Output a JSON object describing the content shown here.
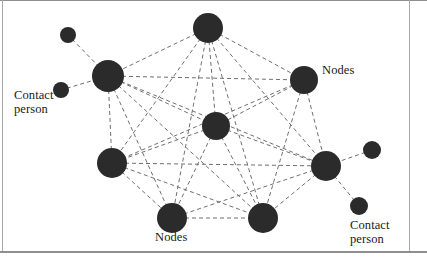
{
  "figure": {
    "width": 427,
    "height": 260,
    "background": "#ffffff",
    "frame_color": "#8e8e8e"
  },
  "style": {
    "node_fill": "#2b2b2b",
    "edge_color": "#6f6f6f",
    "edge_dash": "4 3",
    "edge_width": 1,
    "text_color": "#1a1a1a"
  },
  "labels": [
    {
      "id": "label-contact-left",
      "text": "Contact\nperson",
      "line1": "Contact",
      "line2": "person",
      "x": 14,
      "y": 88,
      "align": "left"
    },
    {
      "id": "label-nodes-right",
      "text": "Nodes",
      "line1": "Nodes",
      "line2": "",
      "x": 322,
      "y": 63,
      "align": "left"
    },
    {
      "id": "label-nodes-bottom",
      "text": "Nodes",
      "line1": "Nodes",
      "line2": "",
      "x": 155,
      "y": 230,
      "align": "left"
    },
    {
      "id": "label-contact-right",
      "text": "Contact\nperson",
      "line1": "Contact",
      "line2": "person",
      "x": 350,
      "y": 218,
      "align": "left"
    }
  ],
  "graph": {
    "node_count": 11,
    "main_node_count": 7,
    "contact_node_count": 4,
    "edge_count": 25,
    "nodes": [
      {
        "id": "n-top",
        "label": "Nodes",
        "role": "node",
        "x": 208,
        "y": 28,
        "r": 15
      },
      {
        "id": "n-upper-left",
        "label": "Nodes",
        "role": "node",
        "x": 108,
        "y": 76,
        "r": 16
      },
      {
        "id": "n-upper-right",
        "label": "Nodes",
        "role": "node",
        "x": 304,
        "y": 80,
        "r": 14
      },
      {
        "id": "n-center",
        "label": "Nodes",
        "role": "node",
        "x": 216,
        "y": 126,
        "r": 14
      },
      {
        "id": "n-lower-left",
        "label": "Nodes",
        "role": "node",
        "x": 112,
        "y": 163,
        "r": 15
      },
      {
        "id": "n-lower-right",
        "label": "Nodes",
        "role": "node",
        "x": 326,
        "y": 166,
        "r": 15
      },
      {
        "id": "n-bottom-left",
        "label": "Nodes",
        "role": "node",
        "x": 172,
        "y": 218,
        "r": 15
      },
      {
        "id": "n-bottom-right",
        "label": "Nodes",
        "role": "node",
        "x": 263,
        "y": 218,
        "r": 15
      },
      {
        "id": "c-left-top",
        "label": "Contact person",
        "role": "contact",
        "x": 68,
        "y": 35,
        "r": 8
      },
      {
        "id": "c-left-bottom",
        "label": "Contact person",
        "role": "contact",
        "x": 61,
        "y": 90,
        "r": 8
      },
      {
        "id": "c-right-top",
        "label": "Contact person",
        "role": "contact",
        "x": 372,
        "y": 150,
        "r": 9
      },
      {
        "id": "c-right-bottom",
        "label": "Contact person",
        "role": "contact",
        "x": 359,
        "y": 206,
        "r": 9
      }
    ],
    "edges": [
      {
        "from": "n-top",
        "to": "n-upper-left"
      },
      {
        "from": "n-top",
        "to": "n-upper-right"
      },
      {
        "from": "n-top",
        "to": "n-center"
      },
      {
        "from": "n-top",
        "to": "n-lower-left"
      },
      {
        "from": "n-top",
        "to": "n-lower-right"
      },
      {
        "from": "n-top",
        "to": "n-bottom-left"
      },
      {
        "from": "n-top",
        "to": "n-bottom-right"
      },
      {
        "from": "n-upper-left",
        "to": "n-upper-right"
      },
      {
        "from": "n-upper-left",
        "to": "n-center"
      },
      {
        "from": "n-upper-left",
        "to": "n-lower-left"
      },
      {
        "from": "n-upper-left",
        "to": "n-lower-right"
      },
      {
        "from": "n-upper-left",
        "to": "n-bottom-left"
      },
      {
        "from": "n-upper-left",
        "to": "n-bottom-right"
      },
      {
        "from": "n-upper-right",
        "to": "n-center"
      },
      {
        "from": "n-upper-right",
        "to": "n-lower-left"
      },
      {
        "from": "n-upper-right",
        "to": "n-lower-right"
      },
      {
        "from": "n-upper-right",
        "to": "n-bottom-right"
      },
      {
        "from": "n-center",
        "to": "n-lower-left"
      },
      {
        "from": "n-center",
        "to": "n-lower-right"
      },
      {
        "from": "n-center",
        "to": "n-bottom-left"
      },
      {
        "from": "n-center",
        "to": "n-bottom-right"
      },
      {
        "from": "n-lower-left",
        "to": "n-lower-right"
      },
      {
        "from": "n-lower-left",
        "to": "n-bottom-left"
      },
      {
        "from": "n-lower-left",
        "to": "n-bottom-right"
      },
      {
        "from": "n-lower-right",
        "to": "n-bottom-left"
      },
      {
        "from": "n-lower-right",
        "to": "n-bottom-right"
      },
      {
        "from": "n-bottom-left",
        "to": "n-bottom-right"
      },
      {
        "from": "c-left-top",
        "to": "n-upper-left"
      },
      {
        "from": "c-left-bottom",
        "to": "n-upper-left"
      },
      {
        "from": "c-right-top",
        "to": "n-lower-right"
      },
      {
        "from": "c-right-bottom",
        "to": "n-lower-right"
      }
    ]
  }
}
